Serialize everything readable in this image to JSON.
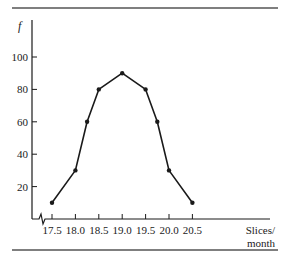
{
  "chart_data": {
    "type": "line",
    "title": "",
    "xlabel": "Slices/ month",
    "xlabel_lines": [
      "Slices/",
      "month"
    ],
    "ylabel": "f",
    "x_ticks": [
      17.5,
      18.0,
      18.5,
      19.0,
      19.5,
      20.0,
      20.5
    ],
    "x_tick_labels": [
      "17.5",
      "18.0",
      "18.5",
      "19.0",
      "19.5",
      "20.0",
      "20.5"
    ],
    "y_ticks": [
      20,
      40,
      60,
      80,
      100
    ],
    "y_tick_labels": [
      "20",
      "40",
      "60",
      "80",
      "100"
    ],
    "xlim": [
      17.05,
      21.5
    ],
    "ylim": [
      0,
      110
    ],
    "x_axis_break": true,
    "grid": false,
    "legend": null,
    "series": [
      {
        "name": "f",
        "x": [
          17.5,
          18.0,
          18.25,
          18.5,
          19.0,
          19.5,
          19.75,
          20.0,
          20.5
        ],
        "values": [
          10,
          30,
          60,
          80,
          90,
          80,
          60,
          30,
          10
        ],
        "color": "#1a1a1a",
        "marker": "dot"
      }
    ]
  },
  "frame": {
    "top_rule": true,
    "bottom_rule": true,
    "rule_color": "#555555"
  }
}
